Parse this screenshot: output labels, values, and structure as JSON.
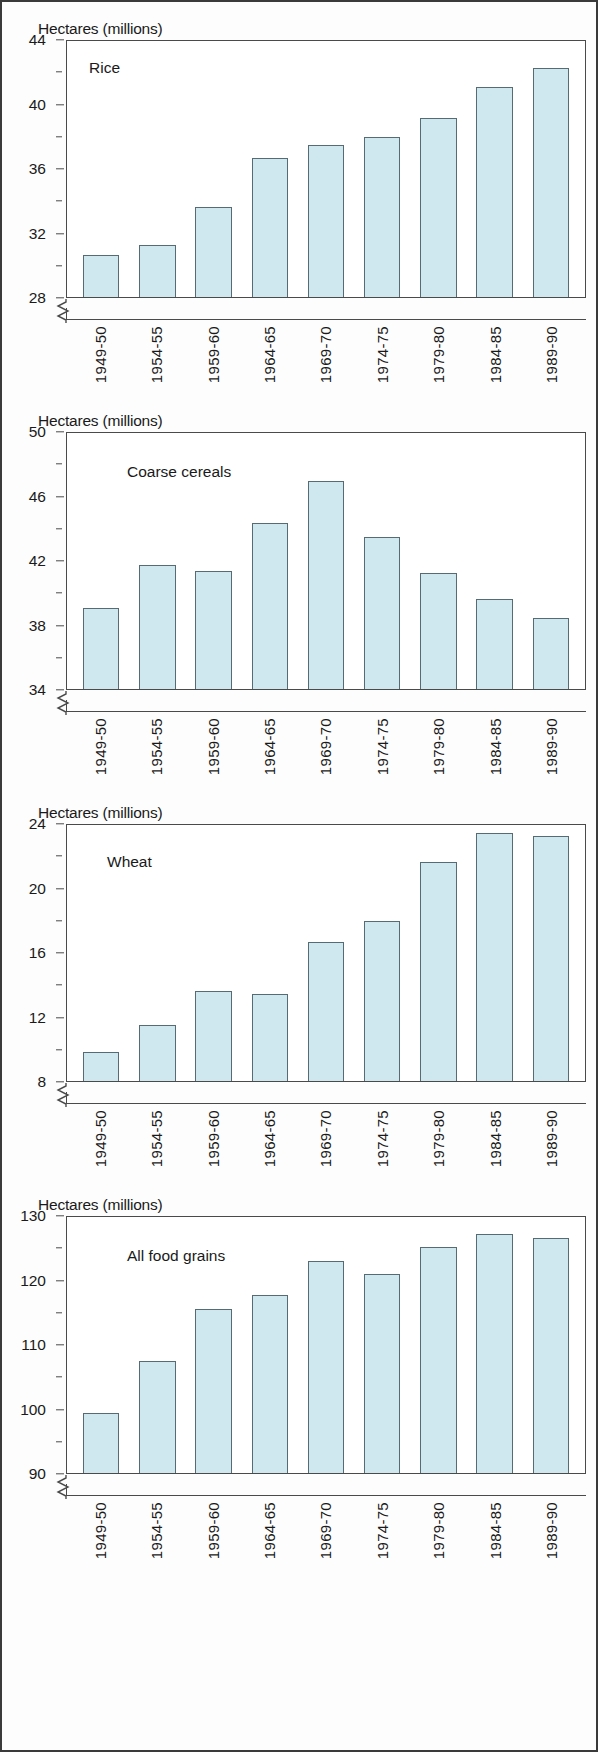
{
  "figure": {
    "y_axis_title": "Hectares (millions)",
    "categories": [
      "1949-50",
      "1954-55",
      "1959-60",
      "1964-65",
      "1969-70",
      "1974-75",
      "1979-80",
      "1984-85",
      "1989-90"
    ],
    "bar_fill_color": "#cfe7ef",
    "bar_border_color": "#566b74",
    "axis_color": "#4a4a4a"
  },
  "chart_data": [
    {
      "type": "bar",
      "title": "Rice",
      "ylabel": "Hectares (millions)",
      "xlabel": "",
      "categories": [
        "1949-50",
        "1954-55",
        "1959-60",
        "1964-65",
        "1969-70",
        "1974-75",
        "1979-80",
        "1984-85",
        "1989-90"
      ],
      "values": [
        30.6,
        31.2,
        33.6,
        36.6,
        37.4,
        37.9,
        39.1,
        41.0,
        42.2
      ],
      "ylim": [
        28,
        44
      ],
      "yticks": [
        28,
        32,
        36,
        40,
        44
      ],
      "yminorticks": [
        30,
        34,
        38,
        42
      ],
      "axis_break": true,
      "grid": false,
      "legend": "none"
    },
    {
      "type": "bar",
      "title": "Coarse cereals",
      "ylabel": "Hectares (millions)",
      "xlabel": "",
      "categories": [
        "1949-50",
        "1954-55",
        "1959-60",
        "1964-65",
        "1969-70",
        "1974-75",
        "1979-80",
        "1984-85",
        "1989-90"
      ],
      "values": [
        39.0,
        41.7,
        41.3,
        44.3,
        46.9,
        43.4,
        41.2,
        39.6,
        38.4
      ],
      "ylim": [
        34,
        50
      ],
      "yticks": [
        34,
        38,
        42,
        46,
        50
      ],
      "yminorticks": [
        36,
        40,
        44,
        48
      ],
      "axis_break": true,
      "grid": false,
      "legend": "none"
    },
    {
      "type": "bar",
      "title": "Wheat",
      "ylabel": "Hectares (millions)",
      "xlabel": "",
      "categories": [
        "1949-50",
        "1954-55",
        "1959-60",
        "1964-65",
        "1969-70",
        "1974-75",
        "1979-80",
        "1984-85",
        "1989-90"
      ],
      "values": [
        9.8,
        11.5,
        13.6,
        13.4,
        16.6,
        17.9,
        21.6,
        23.4,
        23.2
      ],
      "ylim": [
        8,
        24
      ],
      "yticks": [
        8,
        12,
        16,
        20,
        24
      ],
      "yminorticks": [
        10,
        14,
        18,
        22
      ],
      "axis_break": true,
      "grid": false,
      "legend": "none"
    },
    {
      "type": "bar",
      "title": "All food grains",
      "ylabel": "Hectares (millions)",
      "xlabel": "",
      "categories": [
        "1949-50",
        "1954-55",
        "1959-60",
        "1964-65",
        "1969-70",
        "1974-75",
        "1979-80",
        "1984-85",
        "1989-90"
      ],
      "values": [
        99.3,
        107.4,
        115.4,
        117.6,
        122.8,
        120.9,
        125.1,
        127.0,
        126.4
      ],
      "ylim": [
        90,
        130
      ],
      "yticks": [
        90,
        100,
        110,
        120,
        130
      ],
      "yminorticks": [
        95,
        105,
        115,
        125
      ],
      "axis_break": true,
      "grid": false,
      "legend": "none"
    }
  ]
}
